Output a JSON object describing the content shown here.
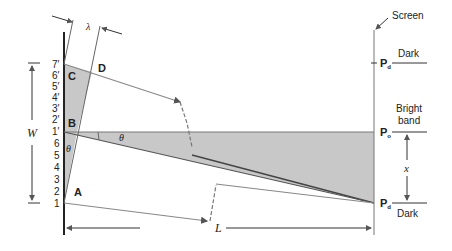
{
  "diagram": {
    "labels": {
      "screen": "Screen",
      "dark_top": "Dark",
      "bright_line1": "Bright",
      "bright_line2": "band",
      "dark_bottom": "Dark",
      "lambda": "λ",
      "W": "W",
      "L": "L",
      "x": "x",
      "theta_left": "θ",
      "theta_right": "θ",
      "A": "A",
      "B": "B",
      "C": "C",
      "D": "D",
      "Pd_top": "P",
      "Pd_top_sub": "d",
      "Po": "P",
      "Po_sub": "o",
      "Pd_bottom": "P",
      "Pd_bottom_sub": "d"
    },
    "slit_ticks_primed": [
      "7′",
      "6′",
      "5′",
      "4′",
      "3′",
      "2′",
      "1′"
    ],
    "slit_ticks": [
      "6",
      "5",
      "4",
      "3",
      "2",
      "1"
    ],
    "colors": {
      "shade": "#c8c8c8",
      "line": "#777777",
      "dark_line": "#333333"
    }
  }
}
